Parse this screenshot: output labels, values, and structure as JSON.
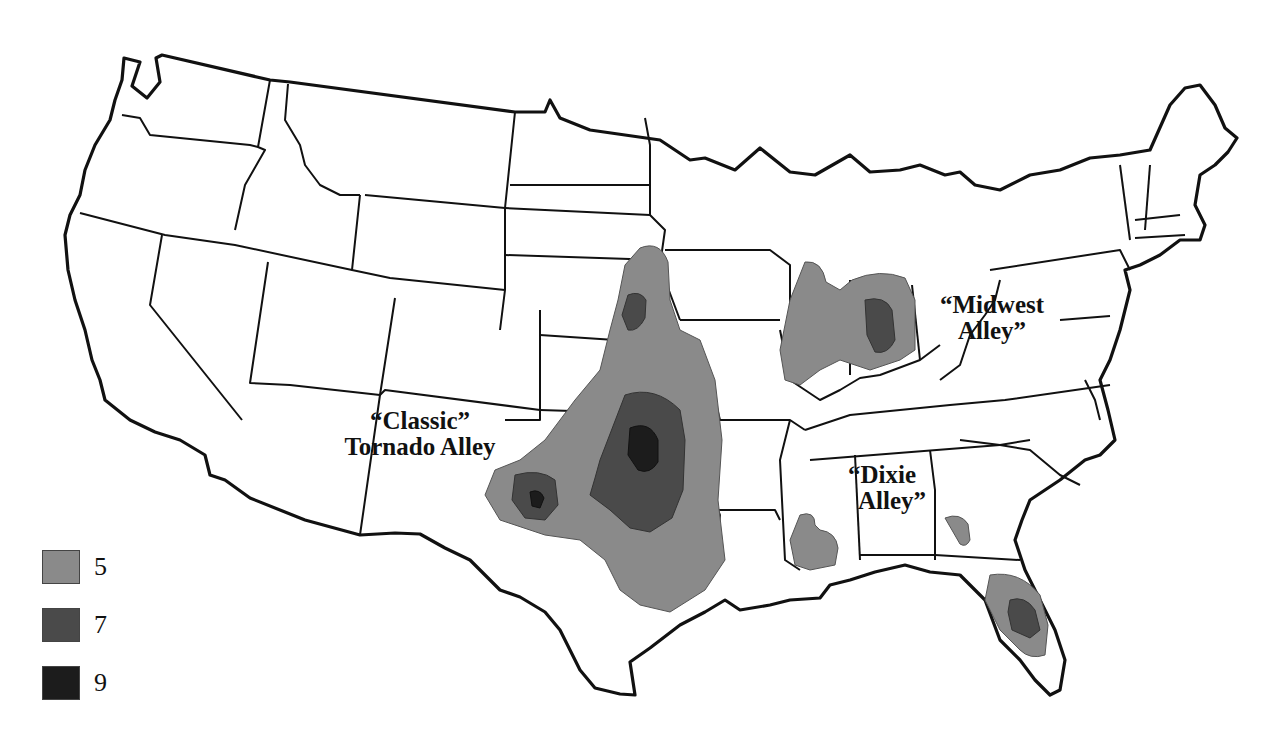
{
  "map": {
    "title": "",
    "subject": "Tornado alleys of the contiguous United States",
    "labels": {
      "classic": {
        "line1": "“Classic”",
        "line2": "Tornado Alley"
      },
      "midwest": {
        "line1": "“Midwest",
        "line2": "Alley”"
      },
      "dixie": {
        "line1": "“Dixie",
        "line2": "Alley”"
      }
    },
    "legend": {
      "items": [
        {
          "value": "5",
          "color": "#8a8a8a"
        },
        {
          "value": "7",
          "color": "#4a4a4a"
        },
        {
          "value": "9",
          "color": "#1c1c1c"
        }
      ]
    },
    "regions": [
      {
        "name": "Classic Tornado Alley",
        "levels": [
          "5",
          "7",
          "9"
        ],
        "states": [
          "Texas",
          "Oklahoma",
          "Kansas",
          "Nebraska",
          "South Dakota",
          "Iowa",
          "Missouri"
        ]
      },
      {
        "name": "Midwest Alley",
        "levels": [
          "5",
          "7"
        ],
        "states": [
          "Illinois",
          "Indiana",
          "Ohio"
        ]
      },
      {
        "name": "Dixie Alley",
        "levels": [
          "5",
          "7"
        ],
        "states": [
          "Mississippi",
          "Georgia",
          "Florida"
        ]
      }
    ]
  }
}
